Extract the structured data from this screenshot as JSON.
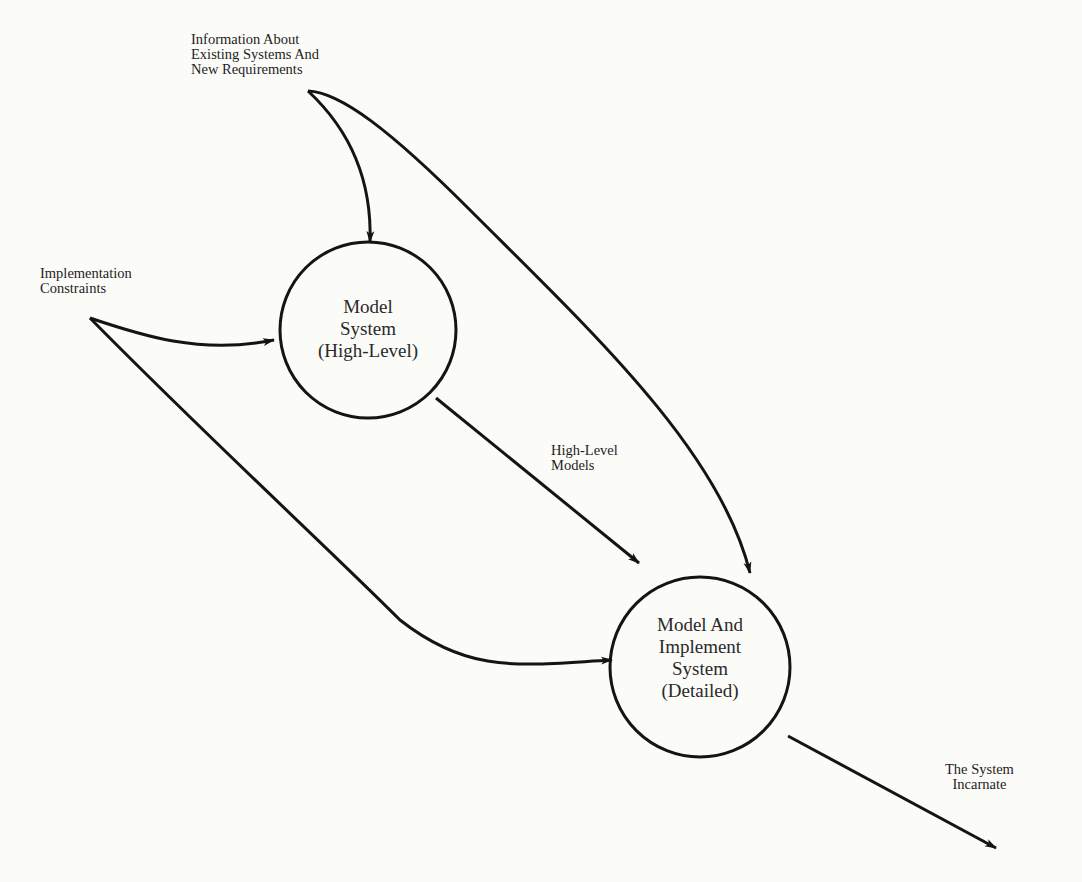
{
  "diagram": {
    "type": "data-flow",
    "nodes": [
      {
        "id": "model-system-high-level",
        "lines": [
          "Model",
          "System",
          "(High-Level)"
        ],
        "cx": 368,
        "cy": 330,
        "r": 88
      },
      {
        "id": "model-and-implement-system-detailed",
        "lines": [
          "Model And",
          "Implement",
          "System",
          "(Detailed)"
        ],
        "cx": 700,
        "cy": 667,
        "r": 90
      }
    ],
    "inputs": {
      "information": {
        "lines": [
          "Information About",
          "Existing Systems And",
          "New Requirements"
        ]
      },
      "constraints": {
        "lines": [
          "Implementation",
          "Constraints"
        ]
      }
    },
    "flows": {
      "high_level_models": {
        "lines": [
          "High-Level",
          "Models"
        ]
      },
      "system_incarnate": {
        "lines": [
          "The System",
          "Incarnate"
        ]
      }
    },
    "edges": [
      {
        "from": "information",
        "to": "model-system-high-level"
      },
      {
        "from": "information",
        "to": "model-and-implement-system-detailed"
      },
      {
        "from": "constraints",
        "to": "model-system-high-level"
      },
      {
        "from": "constraints",
        "to": "model-and-implement-system-detailed"
      },
      {
        "from": "model-system-high-level",
        "to": "model-and-implement-system-detailed",
        "label": "High-Level Models"
      },
      {
        "from": "model-and-implement-system-detailed",
        "to": "output",
        "label": "The System Incarnate"
      }
    ],
    "colors": {
      "stroke": "#141414",
      "background": "#fbfbf8"
    }
  }
}
